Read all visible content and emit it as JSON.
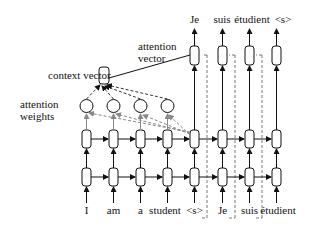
{
  "labels": {
    "context_vector": "context vector",
    "attention_vector_line1": "attention",
    "attention_vector_line2": "vector",
    "attention_weights_line1": "attention",
    "attention_weights_line2": "weights"
  },
  "encoder_inputs": [
    "I",
    "am",
    "a",
    "student"
  ],
  "decoder_inputs": [
    "<s>",
    "Je",
    "suis",
    "étudient"
  ],
  "decoder_outputs": [
    "Je",
    "suis",
    "étudient",
    "<s>"
  ],
  "colors": {
    "line": "#111111",
    "attention_dashed": "#888888",
    "background": "#ffffff"
  }
}
